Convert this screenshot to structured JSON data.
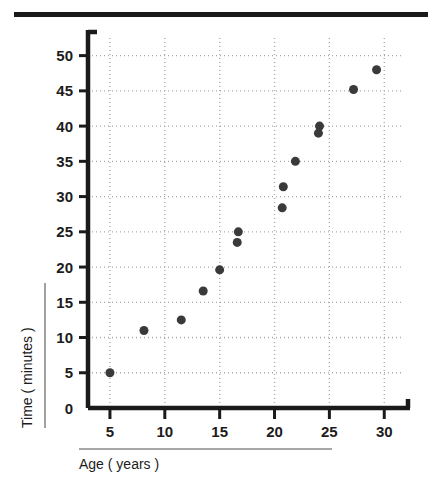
{
  "figure": {
    "top_rule_color": "#1a1a1a",
    "background": "#ffffff"
  },
  "chart_data": {
    "type": "scatter",
    "title": "",
    "subtitle": "",
    "xlabel": "Age ( years )",
    "ylabel": "Time ( minutes )",
    "xlim": [
      3.0,
      31.8
    ],
    "ylim": [
      0,
      52.5
    ],
    "xticks": [
      5,
      10,
      15,
      20,
      25,
      30
    ],
    "xtick_labels": [
      "5",
      "10",
      "15",
      "20",
      "25",
      "30"
    ],
    "yticks": [
      0,
      5,
      10,
      15,
      20,
      25,
      30,
      35,
      40,
      45,
      50
    ],
    "ytick_labels": [
      "0",
      "5",
      "10",
      "15",
      "20",
      "25",
      "30",
      "35",
      "40",
      "45",
      "50"
    ],
    "grid": true,
    "grid_style": "dotted",
    "grid_color": "#a9a9a9",
    "legend": null,
    "legend_position": "none",
    "marker": "circle",
    "marker_color": "#3a3a3a",
    "marker_size": 9,
    "axis_color": "#1a1a1a",
    "series": [
      {
        "name": "observations",
        "points": [
          {
            "x": 5.0,
            "y": 5.0
          },
          {
            "x": 8.1,
            "y": 11.0
          },
          {
            "x": 11.5,
            "y": 12.5
          },
          {
            "x": 13.5,
            "y": 16.6
          },
          {
            "x": 15.0,
            "y": 19.6
          },
          {
            "x": 16.6,
            "y": 23.5
          },
          {
            "x": 16.7,
            "y": 25.0
          },
          {
            "x": 20.7,
            "y": 28.4
          },
          {
            "x": 20.8,
            "y": 31.4
          },
          {
            "x": 21.9,
            "y": 35.0
          },
          {
            "x": 24.0,
            "y": 39.0
          },
          {
            "x": 24.1,
            "y": 40.0
          },
          {
            "x": 27.2,
            "y": 45.2
          },
          {
            "x": 29.3,
            "y": 48.0
          }
        ]
      }
    ]
  }
}
